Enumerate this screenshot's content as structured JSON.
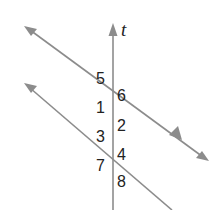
{
  "diagram": {
    "transversal_label": "t",
    "angle_labels": {
      "a5": "5",
      "a6": "6",
      "a1": "1",
      "a2": "2",
      "a3": "3",
      "a4": "4",
      "a7": "7",
      "a8": "8"
    },
    "line_color": "#8c8c8c",
    "text_color": "#222222",
    "parallel_marker": "single arrowhead on upper parallel line indicating parallel lines"
  }
}
